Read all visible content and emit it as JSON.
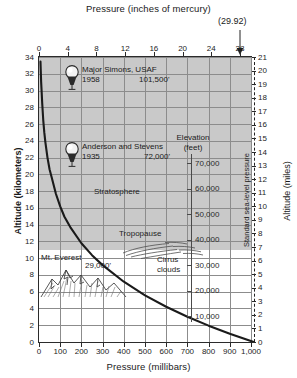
{
  "chart_data": {
    "type": "line",
    "title": "Pressure (inches of mercury)",
    "xlabel": "Pressure (millibars)",
    "ylabel": "Altitude (kilometers)",
    "y2label": "Altitude (miles)",
    "y3label_line1": "Elevation",
    "y3label_line2": "(feet)",
    "xlim": [
      0,
      1000
    ],
    "ylim": [
      0,
      34
    ],
    "y2lim": [
      0,
      21
    ],
    "grid": true,
    "legend_position": "none",
    "x_ticks": [
      "0",
      "100",
      "200",
      "300",
      "400",
      "500",
      "600",
      "700",
      "800",
      "900",
      "1,000"
    ],
    "x_tick_values": [
      0,
      100,
      200,
      300,
      400,
      500,
      600,
      700,
      800,
      900,
      1000
    ],
    "top_ticks": [
      "0",
      "4",
      "8",
      "12",
      "16",
      "20",
      "24",
      "28"
    ],
    "top_tick_values_inhg": [
      0,
      4,
      8,
      12,
      16,
      20,
      24,
      28
    ],
    "top_tick_values_mb": [
      0,
      135.5,
      270.9,
      406.4,
      541.8,
      677.3,
      812.8,
      948.2
    ],
    "y_ticks": [
      "0",
      "2",
      "4",
      "6",
      "8",
      "10",
      "12",
      "14",
      "16",
      "18",
      "20",
      "22",
      "24",
      "26",
      "28",
      "30",
      "32",
      "34"
    ],
    "y_tick_values": [
      0,
      2,
      4,
      6,
      8,
      10,
      12,
      14,
      16,
      18,
      20,
      22,
      24,
      26,
      28,
      30,
      32,
      34
    ],
    "y2_ticks": [
      "0",
      "1",
      "2",
      "3",
      "4",
      "5",
      "6",
      "7",
      "8",
      "9",
      "10",
      "11",
      "12",
      "13",
      "14",
      "15",
      "16",
      "17",
      "18",
      "19",
      "20",
      "21"
    ],
    "y2_tick_values": [
      0,
      1,
      2,
      3,
      4,
      5,
      6,
      7,
      8,
      9,
      10,
      11,
      12,
      13,
      14,
      15,
      16,
      17,
      18,
      19,
      20,
      21
    ],
    "elevation_ticks": [
      "10,000",
      "20,000",
      "30,000",
      "40,000",
      "50,000",
      "60,000",
      "70,000"
    ],
    "elevation_tick_values_ft": [
      10000,
      20000,
      30000,
      40000,
      50000,
      60000,
      70000
    ],
    "series": [
      {
        "name": "Standard atmosphere pressure vs altitude",
        "x_pressure_mb": [
          1013,
          900,
          800,
          700,
          600,
          500,
          400,
          300,
          250,
          200,
          150,
          120,
          100,
          80,
          60,
          50,
          40,
          30,
          25,
          20,
          15,
          12,
          10,
          8,
          7
        ],
        "y_altitude_km": [
          0,
          0.99,
          1.95,
          3.01,
          4.21,
          5.57,
          7.19,
          9.17,
          10.36,
          11.78,
          13.61,
          14.94,
          16.18,
          17.66,
          19.63,
          20.58,
          22.0,
          23.85,
          25.0,
          26.48,
          28.54,
          30.12,
          31.06,
          32.6,
          33.45
        ]
      }
    ],
    "shaded_region": {
      "label": "Stratosphere",
      "from_km": 11,
      "to_km": 34
    },
    "annotations": [
      {
        "name": "balloon-simons",
        "label_line1": "Major Simons, USAF",
        "year": "1958",
        "altitude": "101,500'",
        "altitude_km": 30.94
      },
      {
        "name": "balloon-anderson",
        "label_line1": "Anderson and Stevens",
        "year": "1935",
        "altitude": "72,000'",
        "altitude_km": 21.95
      },
      {
        "name": "stratosphere-label",
        "label": "Stratosphere"
      },
      {
        "name": "tropopause-label",
        "label": "Tropopause"
      },
      {
        "name": "cirrus-label",
        "label_line1": "Cirrus",
        "label_line2": "clouds"
      },
      {
        "name": "mt-everest",
        "label": "Mt. Everest",
        "altitude": "29,000'",
        "altitude_km": 8.84
      },
      {
        "name": "standard-sea-level-pressure",
        "label": "Standard sea-level pressure",
        "value_inhg": "(29.92)"
      }
    ]
  },
  "axes": {
    "top_title": "Pressure (inches of mercury)",
    "bottom_title": "Pressure (millibars)",
    "left_title": "Altitude (kilometers)",
    "right_title": "Altitude (miles)",
    "elevation_title_1": "Elevation",
    "elevation_title_2": "(feet)"
  },
  "markers": {
    "simons": {
      "name": "Major Simons, USAF",
      "year": "1958",
      "alt": "101,500'"
    },
    "anderson": {
      "name": "Anderson and Stevens",
      "year": "1935",
      "alt": "72,000'"
    },
    "everest": {
      "name": "Mt. Everest",
      "alt": "29,000'"
    },
    "stratosphere": "Stratosphere",
    "tropopause": "Tropopause",
    "cirrus_1": "Cirrus",
    "cirrus_2": "clouds"
  },
  "std_pressure": {
    "value": "(29.92)",
    "label": "Standard sea-level pressure"
  },
  "colors": {
    "shade": "#c9c9c9",
    "grid": "#8c8c8c",
    "curve": "#1a1a1a",
    "frame": "#2b2b2b",
    "text": "#1d1d1d"
  }
}
